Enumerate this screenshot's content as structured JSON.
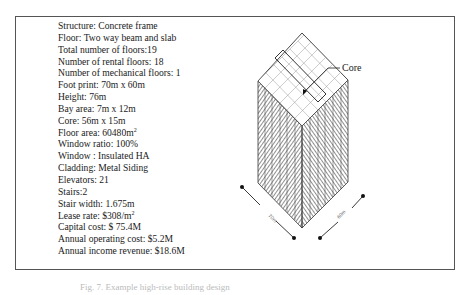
{
  "figure": {
    "specs": [
      {
        "label": "Structure",
        "sep": ": ",
        "value": "Concrete frame"
      },
      {
        "label": "Floor",
        "sep": ": ",
        "value": "Two way beam and slab"
      },
      {
        "label": "Total number of floors",
        "sep": ":",
        "value": "19"
      },
      {
        "label": "Number of rental floors",
        "sep": ": ",
        "value": "18"
      },
      {
        "label": "Number of mechanical floors",
        "sep": ": ",
        "value": "1"
      },
      {
        "label": "Foot print",
        "sep": ": ",
        "value": "70m x 60m"
      },
      {
        "label": "Height",
        "sep": ": ",
        "value": "76m"
      },
      {
        "label": "Bay area",
        "sep": ": ",
        "value": "7m x 12m"
      },
      {
        "label": "Core",
        "sep": ": ",
        "value": "56m x 15m"
      },
      {
        "label": "Floor area",
        "sep": ": ",
        "value": "60480m",
        "sup": "2"
      },
      {
        "label": "Window ratio",
        "sep": ": ",
        "value": "100%"
      },
      {
        "label": "Window ",
        "sep": ": ",
        "value": "Insulated HA"
      },
      {
        "label": "Cladding",
        "sep": ": ",
        "value": "Metal Siding"
      },
      {
        "label": "Elevators",
        "sep": ": ",
        "value": "21"
      },
      {
        "label": "Stairs",
        "sep": ":",
        "value": "2"
      },
      {
        "label": "Stair width",
        "sep": ": ",
        "value": "1.675m"
      },
      {
        "label": "Lease rate",
        "sep": ": ",
        "value": "$308/m",
        "sup": "2"
      },
      {
        "label": "Capital cost",
        "sep": ": ",
        "value": "$ 75.4M"
      },
      {
        "label": "Annual operating cost",
        "sep": ": ",
        "value": "$5.2M"
      },
      {
        "label": "Annual income revenue",
        "sep": ": ",
        "value": "$18.6M"
      }
    ],
    "drawing": {
      "core_label": "Core",
      "dim_left": "70m",
      "dim_right": "60m"
    },
    "caption": "Fig. 7. Example high-rise building design"
  }
}
